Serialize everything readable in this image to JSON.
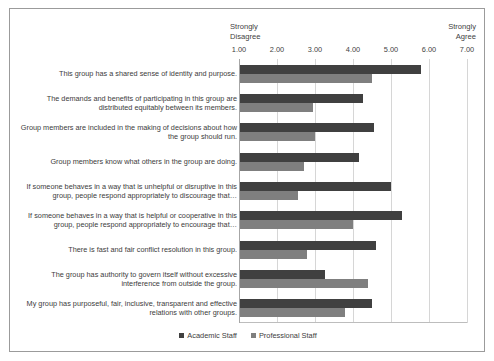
{
  "chart_data": {
    "type": "bar",
    "orientation": "horizontal",
    "title": "",
    "xlabel": "",
    "ylabel": "",
    "xlim": [
      1.0,
      7.0
    ],
    "grid": true,
    "legend_position": "bottom",
    "axis_anchor_low": "Strongly\nDisagree",
    "axis_anchor_high": "Strongly\nAgree",
    "tick_labels": [
      "1.00",
      "2.00",
      "3.00",
      "4.00",
      "5.00",
      "6.00",
      "7.00"
    ],
    "tick_values": [
      1.0,
      2.0,
      3.0,
      4.0,
      5.0,
      6.0,
      7.0
    ],
    "categories": [
      "This group has a shared sense of identity and purpose.",
      "The demands and benefits of participating in this group are distributed equitably between its members.",
      "Group members are included in the making of decisions about how the group should run.",
      "Group members know what others in the group are doing.",
      "If someone behaves in a way that is unhelpful or disruptive in this group, people respond appropriately to discourage that…",
      "If someone behaves in a way that is helpful or cooperative in this group, people respond appropriately to encourage that…",
      "There is fast and fair conflict resolution in this group.",
      "The group has authority to govern itself without excessive interference from outside the group.",
      "My group has purposeful, fair, inclusive, transparent and effective relations with other groups."
    ],
    "series": [
      {
        "name": "Academic Staff",
        "color": "#404040",
        "values": [
          5.8,
          4.25,
          4.55,
          4.15,
          5.0,
          5.3,
          4.6,
          3.25,
          4.5
        ]
      },
      {
        "name": "Professional Staff",
        "color": "#7f7f7f",
        "values": [
          4.5,
          2.95,
          3.0,
          2.7,
          2.55,
          4.0,
          2.8,
          4.4,
          3.8
        ]
      }
    ]
  }
}
